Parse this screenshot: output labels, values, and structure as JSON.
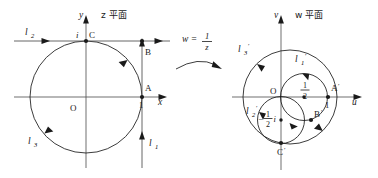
{
  "figure": {
    "caption_left": "z 平面",
    "caption_right": "w 平面",
    "transform_label": "w =",
    "transform_numerator": "1",
    "transform_denominator": "z"
  },
  "left_plane": {
    "title": "z 平面",
    "axis_x_label": "x",
    "axis_y_label": "y",
    "origin_label": "O",
    "points": [
      {
        "name": "A",
        "label": "A",
        "tick_label": "1",
        "x": 1,
        "y": 0
      },
      {
        "name": "B",
        "label": "B",
        "x": 1,
        "y": 1
      },
      {
        "name": "C",
        "label": "C",
        "tick_label": "i",
        "x": 0,
        "y": 1
      }
    ],
    "curves": [
      {
        "name": "l1",
        "label": "l",
        "sub": "1",
        "kind": "vertical-line",
        "equation": "x = 1"
      },
      {
        "name": "l2",
        "label": "l",
        "sub": "2",
        "kind": "horizontal-line",
        "equation": "y = 1"
      },
      {
        "name": "l3",
        "label": "l",
        "sub": "3",
        "kind": "circle",
        "equation": "|z| = 1"
      }
    ]
  },
  "right_plane": {
    "title": "w 平面",
    "axis_x_label": "u",
    "axis_y_label": "v",
    "origin_label": "O",
    "points": [
      {
        "name": "A-prime",
        "label": "A",
        "prime": "′",
        "tick_label": "1",
        "u": 1,
        "v": 0
      },
      {
        "name": "B-prime",
        "label": "B",
        "prime": "′"
      },
      {
        "name": "C-prime",
        "label": "C",
        "prime": "′"
      }
    ],
    "center_labels": [
      {
        "name": "center-half",
        "numerator": "1",
        "denominator": "2",
        "sign": ""
      },
      {
        "name": "center-neg-half-i",
        "numerator": "1",
        "denominator": "2",
        "sign": "−",
        "suffix": "i"
      }
    ],
    "curves": [
      {
        "name": "l1-prime",
        "label": "l",
        "sub": "1",
        "prime": "′",
        "kind": "circle"
      },
      {
        "name": "l2-prime",
        "label": "l",
        "sub": "2",
        "prime": "′",
        "kind": "circle"
      },
      {
        "name": "l3-prime",
        "label": "l",
        "sub": "3",
        "prime": "′",
        "kind": "circle"
      }
    ]
  },
  "colors": {
    "ink": "#1a1a1a",
    "axis": "#555555",
    "background": "#ffffff"
  }
}
